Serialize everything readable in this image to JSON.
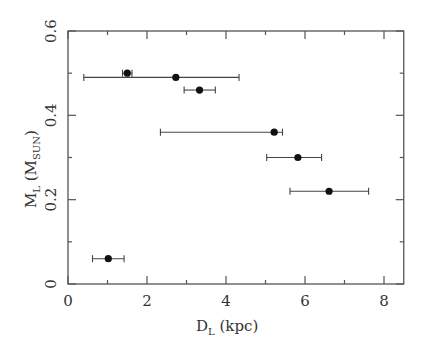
{
  "chart_data": {
    "type": "scatter",
    "title": "",
    "xlabel": "D_L (kpc)",
    "xlabel_main": "D",
    "xlabel_sub": "L",
    "xlabel_unit": " (kpc)",
    "ylabel": "M_L (M_SUN)",
    "ylabel_main": "M",
    "ylabel_sub": "L",
    "ylabel_unit_open": " (M",
    "ylabel_unit_sub": "SUN",
    "ylabel_unit_close": ")",
    "xlim": [
      0,
      8.5
    ],
    "ylim": [
      0,
      0.6
    ],
    "x_major_ticks": [
      0,
      2,
      4,
      6,
      8
    ],
    "x_minor_ticks": [
      1,
      3,
      5,
      7
    ],
    "x_tick_labels": [
      "0",
      "2",
      "4",
      "6",
      "8"
    ],
    "y_major_ticks": [
      0,
      0.2,
      0.4,
      0.6
    ],
    "y_minor_ticks": [
      0.1,
      0.3,
      0.5
    ],
    "y_tick_labels": [
      "0",
      "0.2",
      "0.4",
      "0.6"
    ],
    "grid": false,
    "legend": null,
    "ticks_mirrored": true,
    "series": [
      {
        "name": "lens events",
        "marker": "filled-circle",
        "color": "#111111",
        "points": [
          {
            "x": 1.5,
            "y": 0.5,
            "x_lo": 1.38,
            "x_hi": 1.62
          },
          {
            "x": 2.73,
            "y": 0.49,
            "x_lo": 0.4,
            "x_hi": 4.33
          },
          {
            "x": 3.33,
            "y": 0.46,
            "x_lo": 2.94,
            "x_hi": 3.73
          },
          {
            "x": 5.22,
            "y": 0.36,
            "x_lo": 2.34,
            "x_hi": 5.43
          },
          {
            "x": 5.82,
            "y": 0.3,
            "x_lo": 5.03,
            "x_hi": 6.42
          },
          {
            "x": 6.61,
            "y": 0.22,
            "x_lo": 5.62,
            "x_hi": 7.61
          },
          {
            "x": 1.02,
            "y": 0.06,
            "x_lo": 0.62,
            "x_hi": 1.42
          }
        ]
      }
    ]
  }
}
